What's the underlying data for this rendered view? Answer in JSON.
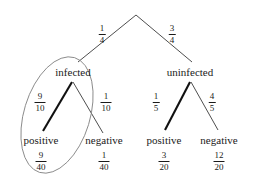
{
  "diagram": {
    "type": "probability-tree",
    "title": "",
    "root": {
      "label": ""
    },
    "level1": [
      {
        "name": "infected",
        "label": "infected",
        "edge_probability": {
          "numerator": "1",
          "denominator": "4"
        }
      },
      {
        "name": "uninfected",
        "label": "uninfected",
        "edge_probability": {
          "numerator": "3",
          "denominator": "4"
        }
      }
    ],
    "level2": [
      {
        "name": "infected-positive",
        "label": "positive",
        "edge_probability": {
          "numerator": "9",
          "denominator": "10"
        },
        "joint_probability": {
          "numerator": "9",
          "denominator": "40"
        },
        "highlighted": true
      },
      {
        "name": "infected-negative",
        "label": "negative",
        "edge_probability": {
          "numerator": "1",
          "denominator": "10"
        },
        "joint_probability": {
          "numerator": "1",
          "denominator": "40"
        },
        "highlighted": false
      },
      {
        "name": "uninfected-positive",
        "label": "positive",
        "edge_probability": {
          "numerator": "1",
          "denominator": "5"
        },
        "joint_probability": {
          "numerator": "3",
          "denominator": "20"
        },
        "highlighted": true
      },
      {
        "name": "uninfected-negative",
        "label": "negative",
        "edge_probability": {
          "numerator": "4",
          "denominator": "5"
        },
        "joint_probability": {
          "numerator": "12",
          "denominator": "20"
        },
        "highlighted": false
      }
    ],
    "annotation": {
      "name": "infected-positive-ellipse",
      "shape": "ellipse",
      "encircles": [
        "infected",
        "9/10",
        "positive",
        "9/40"
      ]
    },
    "colors": {
      "line": "#3a3a3a",
      "bold_line": "#111111",
      "ellipse": "#8a8a8a",
      "text": "#1a1a1a",
      "background": "#ffffff"
    }
  }
}
